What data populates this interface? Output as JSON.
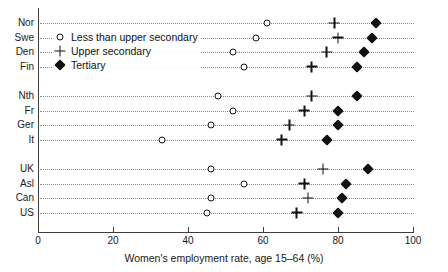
{
  "chart_data": {
    "type": "scatter",
    "title": "",
    "xlabel": "Women's employment rate, age 15–64 (%)",
    "ylabel": "",
    "xlim": [
      0,
      100
    ],
    "xticks": [
      0,
      20,
      40,
      60,
      80,
      100
    ],
    "xtick_labels": [
      "0",
      "20",
      "40",
      "60",
      "80",
      "100"
    ],
    "grid": "horizontal-dotted",
    "legend_position": "upper-left-inside",
    "categories": [
      "Nor",
      "Swe",
      "Den",
      "Fin",
      "Nth",
      "Fr",
      "Ger",
      "It",
      "UK",
      "Asl",
      "Can",
      "US"
    ],
    "group_breaks_after": [
      "Fin",
      "It"
    ],
    "series": [
      {
        "name": "Less than upper secondary",
        "marker": "open-circle",
        "values": [
          61,
          58,
          52,
          55,
          48,
          52,
          46,
          33,
          46,
          55,
          46,
          45
        ]
      },
      {
        "name": "Upper secondary",
        "marker": "plus",
        "values": [
          79,
          80,
          77,
          73,
          73,
          71,
          67,
          65,
          76,
          71,
          72,
          69
        ]
      },
      {
        "name": "Tertiary",
        "marker": "filled-diamond",
        "values": [
          90,
          89,
          87,
          85,
          85,
          80,
          80,
          77,
          88,
          82,
          81,
          80
        ]
      }
    ]
  },
  "legend": {
    "entries": [
      {
        "label": "Less than upper secondary",
        "marker": "open-circle"
      },
      {
        "label": "Upper secondary",
        "marker": "plus"
      },
      {
        "label": "Tertiary",
        "marker": "filled-diamond"
      }
    ]
  },
  "colors": {
    "marker": "#111111",
    "axis": "#3d3d3d",
    "gridline": "#8c8c8c",
    "background": "#ffffff"
  }
}
